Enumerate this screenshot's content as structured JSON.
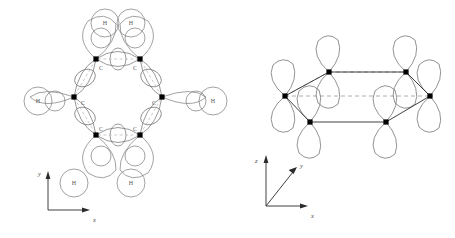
{
  "figure": {
    "panels": [
      {
        "id": "sigma-framework",
        "name": "sigma-framework-panel",
        "description": "Benzene sigma skeleton: six carbon atoms in a planar hexagon joined by overlapping sp2 hybrid orbitals, each carbon bearing one hydrogen 1s orbital",
        "ring_center": {
          "x": 118,
          "y": 97
        },
        "ring_radius": 44,
        "atom_label": "C",
        "hydrogen_label": "H",
        "carbon_count": 6,
        "hydrogen_count": 6,
        "carbons": [
          {
            "label": "C",
            "x": 96,
            "y": 59,
            "label_x": 99,
            "label_y": 70
          },
          {
            "label": "C",
            "x": 140,
            "y": 59,
            "label_x": 135,
            "label_y": 70
          },
          {
            "label": "C",
            "x": 162,
            "y": 97,
            "label_x": 152,
            "label_y": 104
          },
          {
            "label": "C",
            "x": 140,
            "y": 135,
            "label_x": 135,
            "label_y": 130
          },
          {
            "label": "C",
            "x": 96,
            "y": 135,
            "label_x": 99,
            "label_y": 130
          },
          {
            "label": "C",
            "x": 74,
            "y": 97,
            "label_x": 83,
            "label_y": 104
          }
        ],
        "hydrogens": [
          {
            "label": "H",
            "x": 105,
            "y": 21
          },
          {
            "label": "H",
            "x": 163,
            "y": 21
          },
          {
            "label": "H",
            "x": 213,
            "y": 101
          },
          {
            "label": "H",
            "x": 163,
            "y": 183
          },
          {
            "label": "H",
            "x": 74,
            "y": 183
          },
          {
            "label": "H",
            "x": 38,
            "y": 101
          }
        ],
        "axes": {
          "name": "xy-axes",
          "origin": {
            "x": 48,
            "y": 210
          },
          "x": {
            "label": "x",
            "label_x": 95,
            "label_y": 224
          },
          "y": {
            "label": "y",
            "label_x": 38,
            "label_y": 173
          }
        }
      },
      {
        "id": "pi-system",
        "name": "pi-system-panel",
        "description": "Benzene pi system: six unhybridised 2p orbitals perpendicular to the ring plane, drawn in perspective above and below the hexagon",
        "orbital_count": 6,
        "orbital_type": "2p",
        "vertices": [
          {
            "x": 329,
            "y": 72
          },
          {
            "x": 406,
            "y": 72
          },
          {
            "x": 430,
            "y": 96
          },
          {
            "x": 386,
            "y": 122
          },
          {
            "x": 310,
            "y": 122
          },
          {
            "x": 285,
            "y": 96
          }
        ],
        "solid_edges": [
          [
            0,
            1
          ],
          [
            1,
            2
          ],
          [
            2,
            3
          ],
          [
            3,
            4
          ],
          [
            4,
            5
          ]
        ],
        "dashed_edges": [
          [
            5,
            0
          ],
          [
            5,
            2
          ]
        ],
        "axes": {
          "name": "xyz-axes",
          "origin": {
            "x": 266,
            "y": 206
          },
          "x": {
            "label": "x",
            "label_x": 313,
            "label_y": 220
          },
          "y": {
            "label": "y",
            "label_x": 302,
            "label_y": 163
          },
          "z": {
            "label": "z",
            "label_x": 256,
            "label_y": 172
          }
        }
      }
    ],
    "colors": {
      "stroke": "#1a1a1a",
      "orbital_outline": "#808080",
      "dashed": "#9a9a9a",
      "atom_fill": "#000000",
      "background": "#ffffff",
      "label": "#5a5a5a"
    }
  }
}
